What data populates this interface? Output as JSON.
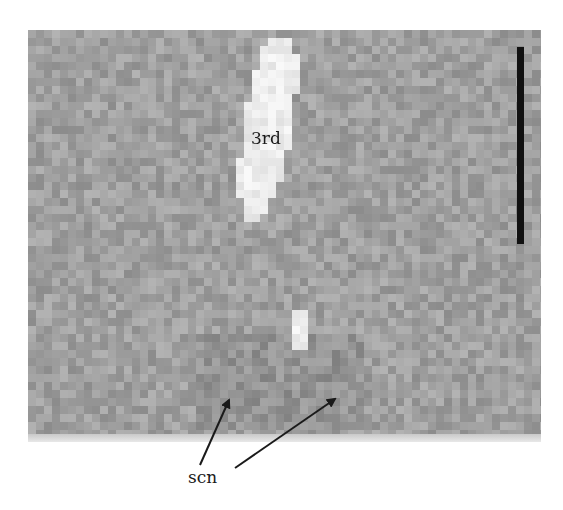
{
  "figure": {
    "panel": {
      "description": "Grayscale MRI slice with pixelated texture",
      "background_color": "#9d9d9d",
      "bright_region_color": "#f0f0f0"
    },
    "labels": {
      "third_ventricle": "3rd",
      "scn": "scn"
    },
    "scale_bar": {
      "color": "#111111",
      "orientation": "vertical"
    },
    "arrows": [
      {
        "from": "scn",
        "target": "left scn region"
      },
      {
        "from": "scn",
        "target": "right scn region"
      }
    ]
  }
}
